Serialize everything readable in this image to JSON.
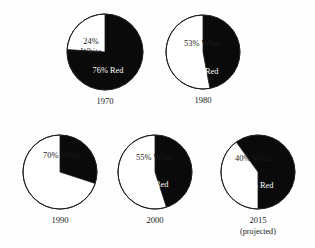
{
  "figure": {
    "background_color": "#fefefe",
    "red_color": "#0a0a0a",
    "white_color": "#ffffff",
    "outline_color": "#1d1d1d"
  },
  "chart_data": {
    "type": "pie",
    "title": "",
    "subtitle": "",
    "xlabel": "",
    "ylabel": "",
    "legend_position": "none",
    "grid": false,
    "note": "Five pie charts showing the White / Red share by year",
    "slice_labels": [
      "White",
      "Red"
    ],
    "charts": [
      {
        "year_label": "1970",
        "year_sub_label": "",
        "cx": 105,
        "cy": 52,
        "r": 38,
        "white_pct": 24,
        "red_pct": 76,
        "white_label": "24%",
        "white_label_line2": "White",
        "red_label": "76% Red",
        "white_start_deg": 0,
        "white_sweep_deg": 86.4,
        "white_direction": "counterclockwise",
        "white_label_x": 91,
        "white_label_y": 42,
        "red_label_x": 108,
        "red_label_y": 71
      },
      {
        "year_label": "1980",
        "year_sub_label": "",
        "cx": 203,
        "cy": 52,
        "r": 37,
        "white_pct": 53,
        "red_pct": 47,
        "white_label": "53% White",
        "white_label_line2": "",
        "red_label": "47% Red",
        "white_start_deg": 0,
        "white_sweep_deg": 190.8,
        "white_direction": "counterclockwise",
        "white_label_x": 203,
        "white_label_y": 44,
        "red_label_x": 203,
        "red_label_y": 72
      },
      {
        "year_label": "1990",
        "year_sub_label": "",
        "cx": 60,
        "cy": 172,
        "r": 37,
        "white_pct": 70,
        "red_pct": 30,
        "white_label": "70% White",
        "white_label_line2": "",
        "red_label": "30%",
        "red_label_line2": "Red",
        "white_start_deg": 0,
        "white_sweep_deg": 252,
        "white_direction": "counterclockwise",
        "white_label_x": 62,
        "white_label_y": 156,
        "red_label_x": 49,
        "red_label_y": 180
      },
      {
        "year_label": "2000",
        "year_sub_label": "",
        "cx": 155,
        "cy": 172,
        "r": 37,
        "white_pct": 55,
        "red_pct": 45,
        "white_label": "55% White",
        "white_label_line2": "",
        "red_label": "45% Red",
        "white_start_deg": 0,
        "white_sweep_deg": 198,
        "white_direction": "counterclockwise",
        "white_label_x": 155,
        "white_label_y": 158,
        "red_label_x": 153,
        "red_label_y": 185
      },
      {
        "year_label": "2015",
        "year_sub_label": "(projected)",
        "cx": 258,
        "cy": 172,
        "r": 37,
        "white_pct": 40,
        "red_pct": 60,
        "white_label": "40% White",
        "white_label_line2": "",
        "red_label": "60% Red",
        "white_start_deg": 36,
        "white_sweep_deg": 144,
        "white_direction": "counterclockwise",
        "white_label_x": 254,
        "white_label_y": 159,
        "red_label_x": 258,
        "red_label_y": 186
      }
    ]
  }
}
